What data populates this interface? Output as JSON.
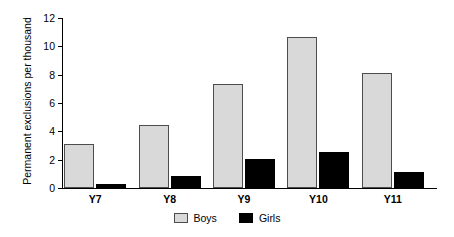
{
  "chart_data": {
    "type": "bar",
    "title": "",
    "xlabel": "",
    "ylabel": "Permanent exclusions per thousand",
    "categories": [
      "Y7",
      "Y8",
      "Y9",
      "Y10",
      "Y11"
    ],
    "series": [
      {
        "name": "Boys",
        "color": "#d9d9d9",
        "values": [
          3.1,
          4.45,
          7.35,
          10.65,
          8.15
        ]
      },
      {
        "name": "Girls",
        "color": "#000000",
        "values": [
          0.25,
          0.85,
          2.05,
          2.55,
          1.15
        ]
      }
    ],
    "ylim": [
      0,
      12
    ],
    "yticks": [
      0,
      2,
      4,
      6,
      8,
      10,
      12
    ],
    "ytick_labels": [
      "0",
      "2",
      "4",
      "6",
      "8",
      "10",
      "12"
    ],
    "grid": false,
    "legend_position": "bottom"
  }
}
